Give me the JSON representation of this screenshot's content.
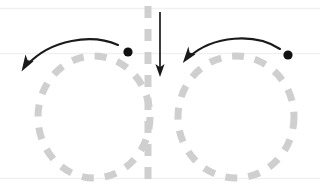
{
  "figure": {
    "width": 320,
    "height": 189,
    "background_color": "#ffffff",
    "colors": {
      "background": "#ffffff",
      "dashed_circle": "#cfcfcf",
      "dashed_vertical_line": "#cfcfcf",
      "guide_line": "#f0f0f0",
      "arrow": "#1a1a1a",
      "dot": "#111111"
    }
  },
  "guide_lines": [
    {
      "name": "top-guide-line",
      "y": 8,
      "x1": 0,
      "x2": 320,
      "color": "#f2f2f2",
      "width": 1
    },
    {
      "name": "middle-guide-line",
      "y": 53,
      "x1": 0,
      "x2": 320,
      "color": "#f2f2f2",
      "width": 1
    },
    {
      "name": "bottom-guide-line",
      "y": 178,
      "x1": 0,
      "x2": 320,
      "color": "#f2f2f2",
      "width": 1
    }
  ],
  "left_shape": {
    "name": "left-dashed-circle",
    "cx": 94,
    "cy": 117,
    "rx": 56,
    "ry": 61,
    "stroke": "#cfcfcf",
    "stroke_width": 7,
    "dash_pattern": "12 11"
  },
  "right_shape": {
    "name": "right-dashed-circle",
    "cx": 236,
    "cy": 117,
    "rx": 58,
    "ry": 61,
    "stroke": "#cfcfcf",
    "stroke_width": 7,
    "dash_pattern": "12 11"
  },
  "left_dot": {
    "name": "left-marker-dot",
    "cx": 128,
    "cy": 52,
    "r": 4.6,
    "fill": "#111111"
  },
  "right_dot": {
    "name": "right-marker-dot",
    "cx": 288,
    "cy": 55,
    "r": 4.6,
    "fill": "#111111"
  },
  "left_curved_arrow": {
    "name": "left-rotation-arrow",
    "path": "M 118 45 C 92 34 52 40 26 66",
    "direction": "counter-clockwise",
    "stroke": "#1a1a1a",
    "stroke_width": 2.1,
    "arrowhead_tip": {
      "x": 22,
      "y": 71
    }
  },
  "right_curved_arrow": {
    "name": "right-rotation-arrow",
    "path": "M 280 49 C 256 33 214 36 188 58",
    "direction": "counter-clockwise",
    "stroke": "#1a1a1a",
    "stroke_width": 2.1,
    "arrowhead_tip": {
      "x": 183,
      "y": 63
    }
  },
  "vertical_dashed_line": {
    "name": "center-dashed-axis",
    "x": 148,
    "y1": 8,
    "y2": 182,
    "stroke": "#cfcfcf",
    "stroke_width": 7,
    "dash_pattern": "12 11"
  },
  "down_arrow": {
    "name": "center-down-arrow",
    "x": 160,
    "y1": 12,
    "y2": 71,
    "stroke": "#1a1a1a",
    "stroke_width": 1.7,
    "arrowhead_tip": {
      "x": 160,
      "y": 76
    }
  }
}
